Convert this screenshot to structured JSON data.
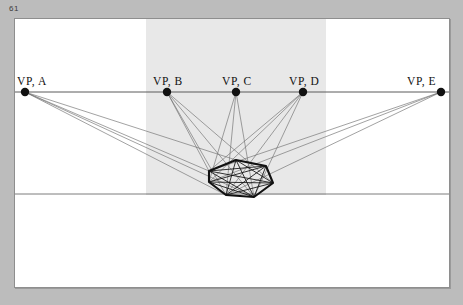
{
  "page": {
    "number": "61",
    "background_color": "#bcbcbc",
    "sheet_color": "#ffffff",
    "sheet_border_color": "#8e8e8e"
  },
  "figure": {
    "title": "",
    "type": "perspective-construction-diagram",
    "ink_color": "#111111",
    "ray_color": "#6f6f6f",
    "line_color": "#5a5a5a",
    "shaded_band_color": "#e8e8e8",
    "shaded_band": {
      "x": 131,
      "y": 0,
      "width": 180,
      "height": 176
    },
    "horizon_line": {
      "y": 73,
      "x1": 0,
      "x2": 434
    },
    "ground_line": {
      "y": 175,
      "x1": 0,
      "x2": 434
    },
    "vanishing_points": [
      {
        "id": "A",
        "label": "VP, A",
        "x": 10,
        "y": 73,
        "label_x": 2,
        "label_y": 56
      },
      {
        "id": "B",
        "label": "VP, B",
        "x": 152,
        "y": 73,
        "label_x": 138,
        "label_y": 56
      },
      {
        "id": "C",
        "label": "VP, C",
        "x": 221,
        "y": 73,
        "label_x": 207,
        "label_y": 56
      },
      {
        "id": "D",
        "label": "VP, D",
        "x": 288,
        "y": 73,
        "label_x": 274,
        "label_y": 56
      },
      {
        "id": "E",
        "label": "VP, E",
        "x": 426,
        "y": 73,
        "label_x": 392,
        "label_y": 56
      }
    ],
    "polygon": {
      "name": "heptagon-in-perspective",
      "vertices": [
        [
          194,
          152
        ],
        [
          221,
          141
        ],
        [
          251,
          147
        ],
        [
          258,
          164
        ],
        [
          239,
          178
        ],
        [
          211,
          176
        ],
        [
          194,
          163
        ]
      ],
      "diagonals": [
        [
          0,
          2
        ],
        [
          0,
          3
        ],
        [
          0,
          4
        ],
        [
          1,
          3
        ],
        [
          1,
          4
        ],
        [
          1,
          5
        ],
        [
          2,
          4
        ],
        [
          2,
          5
        ],
        [
          2,
          6
        ],
        [
          3,
          5
        ],
        [
          3,
          6
        ],
        [
          4,
          6
        ]
      ]
    },
    "rays": [
      {
        "from": "A",
        "to": [
          194,
          152
        ]
      },
      {
        "from": "A",
        "to": [
          221,
          141
        ]
      },
      {
        "from": "A",
        "to": [
          211,
          176
        ]
      },
      {
        "from": "A",
        "to": [
          239,
          178
        ]
      },
      {
        "from": "B",
        "to": [
          194,
          152
        ]
      },
      {
        "from": "B",
        "to": [
          211,
          176
        ]
      },
      {
        "from": "B",
        "to": [
          239,
          178
        ]
      },
      {
        "from": "B",
        "to": [
          258,
          164
        ]
      },
      {
        "from": "C",
        "to": [
          211,
          176
        ]
      },
      {
        "from": "C",
        "to": [
          239,
          178
        ]
      },
      {
        "from": "C",
        "to": [
          194,
          163
        ]
      },
      {
        "from": "D",
        "to": [
          194,
          152
        ]
      },
      {
        "from": "D",
        "to": [
          194,
          163
        ]
      },
      {
        "from": "D",
        "to": [
          211,
          176
        ]
      },
      {
        "from": "D",
        "to": [
          239,
          178
        ]
      },
      {
        "from": "E",
        "to": [
          194,
          152
        ]
      },
      {
        "from": "E",
        "to": [
          194,
          163
        ]
      },
      {
        "from": "E",
        "to": [
          211,
          176
        ]
      }
    ]
  }
}
